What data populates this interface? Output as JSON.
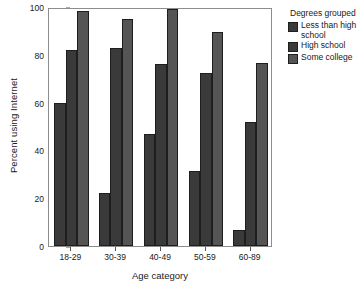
{
  "chart_data": {
    "type": "bar",
    "title": "",
    "subtitle": "",
    "xlabel": "Age category",
    "ylabel": "Percent using Internet",
    "categories": [
      "18-29",
      "30-39",
      "40-49",
      "50-59",
      "60-89"
    ],
    "series": [
      {
        "name": "Less than high school",
        "values": [
          60,
          22,
          47,
          31.5,
          6.5
        ],
        "color": "#3a3a3a"
      },
      {
        "name": "High school",
        "values": [
          82,
          83,
          76,
          72.5,
          52
        ],
        "color": "#3a3a3a"
      },
      {
        "name": "Some college",
        "values": [
          98.5,
          95,
          99,
          89.5,
          76.5
        ],
        "color": "#555555"
      }
    ],
    "ylim": [
      0,
      100
    ],
    "yticks": [
      0,
      20,
      40,
      60,
      80,
      100
    ],
    "grid": false,
    "legend": {
      "title": "Degrees grouped",
      "position": "right",
      "entries": [
        "Less than high school",
        "High school",
        "Some college"
      ]
    },
    "frame_color": "#8d8d8d",
    "bar_edge_color": "#1e1e1e",
    "background": "#ffffff"
  }
}
